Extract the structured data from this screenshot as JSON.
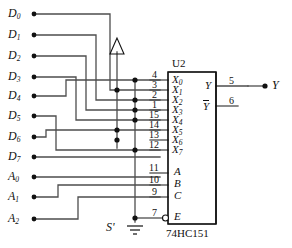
{
  "diagram": {
    "title_chip_designator": "U2",
    "chip_part_number": "74HC151",
    "ground_label": "S'",
    "supply_symbol": "vcc-triangle",
    "left_terminals": [
      {
        "name": "D0",
        "base": "D",
        "sub": "0",
        "y": 14
      },
      {
        "name": "D1",
        "base": "D",
        "sub": "1",
        "y": 35
      },
      {
        "name": "D2",
        "base": "D",
        "sub": "2",
        "y": 56
      },
      {
        "name": "D3",
        "base": "D",
        "sub": "3",
        "y": 77
      },
      {
        "name": "D4",
        "base": "D",
        "sub": "4",
        "y": 96
      },
      {
        "name": "D5",
        "base": "D",
        "sub": "5",
        "y": 116
      },
      {
        "name": "D6",
        "base": "D",
        "sub": "6",
        "y": 137
      },
      {
        "name": "D7",
        "base": "D",
        "sub": "7",
        "y": 157
      },
      {
        "name": "A0",
        "base": "A",
        "sub": "0",
        "y": 177
      },
      {
        "name": "A1",
        "base": "A",
        "sub": "1",
        "y": 197
      },
      {
        "name": "A2",
        "base": "A",
        "sub": "2",
        "y": 219
      }
    ],
    "chip_input_pins": [
      {
        "pin": "4",
        "label_base": "X",
        "label_sub": "0",
        "y": 80
      },
      {
        "pin": "3",
        "label_base": "X",
        "label_sub": "1",
        "y": 90
      },
      {
        "pin": "2",
        "label_base": "X",
        "label_sub": "2",
        "y": 100
      },
      {
        "pin": "1",
        "label_base": "X",
        "label_sub": "3",
        "y": 110
      },
      {
        "pin": "15",
        "label_base": "X",
        "label_sub": "4",
        "y": 120
      },
      {
        "pin": "14",
        "label_base": "X",
        "label_sub": "5",
        "y": 130
      },
      {
        "pin": "13",
        "label_base": "X",
        "label_sub": "6",
        "y": 140
      },
      {
        "pin": "12",
        "label_base": "X",
        "label_sub": "7",
        "y": 150
      }
    ],
    "chip_select_pins": [
      {
        "pin": "11",
        "label_base": "A",
        "label_sub": "",
        "y": 173
      },
      {
        "pin": "10",
        "label_base": "B",
        "label_sub": "",
        "y": 185
      },
      {
        "pin": "9",
        "label_base": "C",
        "label_sub": "",
        "y": 197
      }
    ],
    "chip_enable_pin": {
      "pin": "7",
      "label_base": "E",
      "label_sub": "",
      "y": 218,
      "inverted": true
    },
    "chip_output_pins": [
      {
        "pin": "5",
        "label_base": "Y",
        "overbar": false,
        "y": 86
      },
      {
        "pin": "6",
        "label_base": "Y",
        "overbar": true,
        "y": 106
      }
    ],
    "output_terminal": {
      "name": "Y",
      "y": 86
    },
    "buses": [
      {
        "name": "vcc-bus",
        "x": 117,
        "connects_pins": [
          "3",
          "14",
          "13"
        ]
      },
      {
        "name": "ground-bus",
        "x": 135,
        "connects_pins": [
          "4",
          "2",
          "1",
          "15",
          "12",
          "7"
        ]
      }
    ],
    "direct_wires": [
      {
        "from": "D0",
        "to_pin": "3"
      },
      {
        "from": "D1",
        "to_pin": "2"
      },
      {
        "from": "D2",
        "to_pin": "1"
      },
      {
        "from": "D3",
        "to_pin": "15"
      },
      {
        "from": "D4",
        "to_pin": "4"
      },
      {
        "from": "D5",
        "to_pin": "12"
      },
      {
        "from": "D6",
        "to_pin": "14"
      },
      {
        "from": "D7",
        "to_pin": "12"
      },
      {
        "from": "A0",
        "to_pin": "11"
      },
      {
        "from": "A1",
        "to_pin": "10"
      },
      {
        "from": "A2",
        "to_pin": "9"
      }
    ],
    "colors": {
      "wire": "#4d4d4d",
      "outline": "#111111",
      "dot": "#111111",
      "background": "#ffffff"
    }
  }
}
